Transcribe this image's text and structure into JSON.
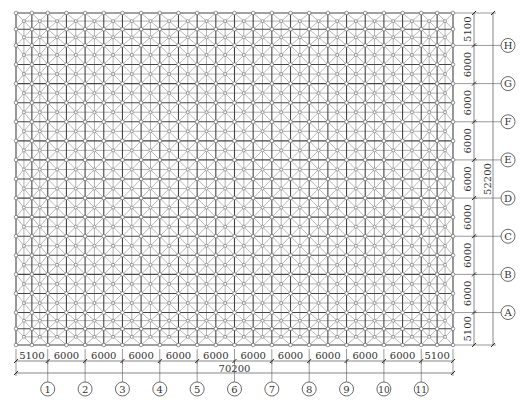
{
  "drawing": {
    "title": "Space truss grid plan",
    "grid_origin": {
      "x": 16,
      "y": 13
    },
    "bays_x_mm": [
      5100,
      6000,
      6000,
      6000,
      6000,
      6000,
      6000,
      6000,
      6000,
      6000,
      6000,
      5100
    ],
    "bays_y_mm": [
      5100,
      6000,
      6000,
      6000,
      6000,
      6000,
      6000,
      6000,
      5100
    ],
    "px_per_mm_x": 0.006225,
    "px_per_mm_y": 0.00636,
    "cells_per_bay": 2,
    "colors": {
      "chord": "#444444",
      "web": "#9a9a9a",
      "node_fill": "#ffffff",
      "node_stroke": "#666666",
      "dim_line": "#555555"
    }
  },
  "dimensions": {
    "bottom": {
      "labels": [
        "5100",
        "6000",
        "6000",
        "6000",
        "6000",
        "6000",
        "6000",
        "6000",
        "6000",
        "6000",
        "6000",
        "5100"
      ],
      "total": "70200"
    },
    "right": {
      "labels_top_to_bottom": [
        "5100",
        "6000",
        "6000",
        "6000",
        "6000",
        "6000",
        "6000",
        "6000",
        "5100"
      ],
      "total": "52200"
    }
  },
  "axes": {
    "columns": [
      "1",
      "2",
      "3",
      "4",
      "5",
      "6",
      "7",
      "8",
      "9",
      "10",
      "11"
    ],
    "rows_top_to_bottom": [
      "H",
      "G",
      "F",
      "E",
      "D",
      "C",
      "B",
      "A"
    ]
  }
}
